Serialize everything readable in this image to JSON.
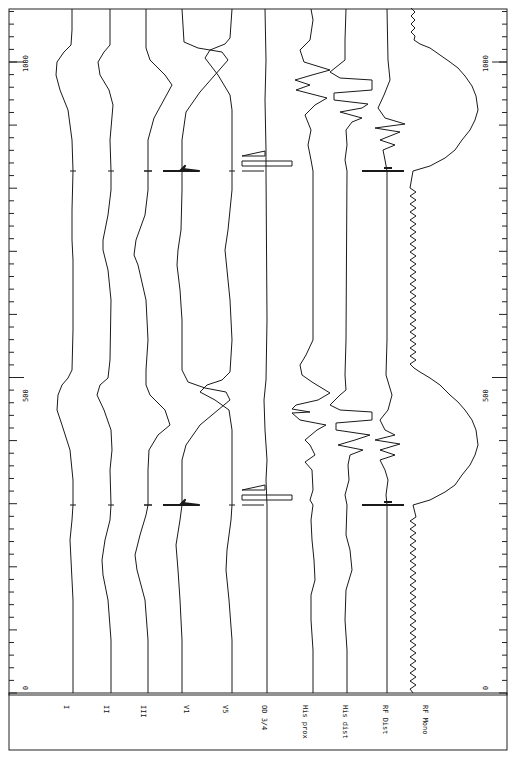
{
  "chart_data": {
    "type": "line",
    "title": "",
    "orientation": "rotated-90 (time runs bottom-to-top, channels left-to-right)",
    "xlabel": "time (ms)",
    "ylabel": "",
    "time_range": [
      0,
      1082
    ],
    "axis_ticks": {
      "labels": [
        "0",
        "500",
        "1000"
      ],
      "values": [
        0,
        500,
        1000
      ],
      "minor_step": 20,
      "major_step": 100
    },
    "grid": false,
    "legend": "channel labels along the bottom margin",
    "channels": [
      {
        "name": "I",
        "baseline_x": 73
      },
      {
        "name": "II",
        "baseline_x": 111
      },
      {
        "name": "III",
        "baseline_x": 148
      },
      {
        "name": "V1",
        "baseline_x": 182
      },
      {
        "name": "V5",
        "baseline_x": 232
      },
      {
        "name": "OD 3/4",
        "baseline_x": 267
      },
      {
        "name": "His prox",
        "baseline_x": 313
      },
      {
        "name": "His dist",
        "baseline_x": 347
      },
      {
        "name": "RF Dist",
        "baseline_x": 387
      },
      {
        "name": "RF Mono",
        "baseline_x": 413
      }
    ],
    "events": {
      "pacing_spike_times_ms": [
        298,
        827
      ],
      "qrs_peak_times_ms": [
        470,
        1000
      ]
    }
  },
  "labels": {
    "axis_left_0": "0",
    "axis_left_500": "500",
    "axis_left_1000": "1000",
    "axis_right_0": "0",
    "axis_right_500": "500",
    "axis_right_1000": "1000",
    "ch_I": "I",
    "ch_II": "II",
    "ch_III": "III",
    "ch_V1": "V1",
    "ch_V5": "V5",
    "ch_OD": "OD 3/4",
    "ch_HisProx": "His prox",
    "ch_HisDist": "His dist",
    "ch_RFDist": "RF Dist",
    "ch_RFMono": "RF Mono"
  },
  "colors": {
    "ink": "#1a1a1a",
    "paper": "#ffffff"
  }
}
